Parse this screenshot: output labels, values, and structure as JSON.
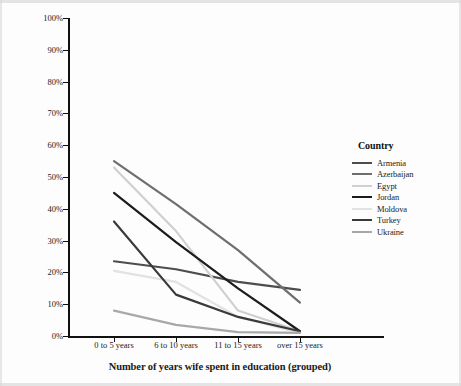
{
  "chart_data": {
    "type": "line",
    "title": "",
    "xlabel": "Number of years wife spent in education (grouped)",
    "ylabel": "Believe GBV is justified, if wife argues with her husband",
    "categories": [
      "0 to 5 years",
      "6 to 10 years",
      "11 to 15 years",
      "over 15 years"
    ],
    "ylim": [
      0,
      100
    ],
    "ytick_labels": [
      "0%",
      "10%",
      "20%",
      "30%",
      "40%",
      "50%",
      "60%",
      "70%",
      "80%",
      "90%",
      "100%"
    ],
    "ytick_values": [
      0,
      10,
      20,
      30,
      40,
      50,
      60,
      70,
      80,
      90,
      100
    ],
    "grid": false,
    "legend_position": "right",
    "legend_title": "Country",
    "series": [
      {
        "name": "Armenia",
        "color": "#4d4d4d",
        "values": [
          23.5,
          21.0,
          17.0,
          14.5
        ]
      },
      {
        "name": "Azerbaijan",
        "color": "#6e6e6e",
        "values": [
          55.0,
          41.5,
          27.0,
          10.5
        ]
      },
      {
        "name": "Egypt",
        "color": "#d0d0d0",
        "values": [
          53.0,
          33.0,
          8.0,
          1.5
        ]
      },
      {
        "name": "Jordan",
        "color": "#1c1c1c",
        "values": [
          45.0,
          29.5,
          15.0,
          1.5
        ]
      },
      {
        "name": "Moldova",
        "color": "#e2e2e2",
        "values": [
          20.5,
          17.0,
          6.0,
          1.0
        ]
      },
      {
        "name": "Turkey",
        "color": "#3a3a3a",
        "values": [
          36.0,
          13.0,
          6.0,
          1.5
        ]
      },
      {
        "name": "Ukraine",
        "color": "#a8a8a8",
        "values": [
          8.0,
          3.5,
          1.2,
          1.0
        ]
      }
    ]
  }
}
